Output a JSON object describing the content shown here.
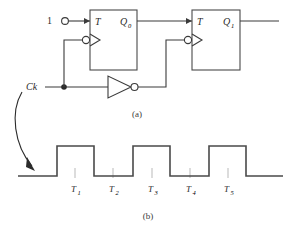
{
  "figure": {
    "colors": {
      "line": "#3b3b3b",
      "box": "#4a4a4a",
      "wave": "#4a4a4a",
      "tick": "#b9b9b9",
      "text": "#2b2b2b",
      "background": "#ffffff"
    }
  },
  "circuit": {
    "caption": "(a)",
    "input": {
      "label": "1",
      "terminal": "open-circle-terminal"
    },
    "clock": {
      "label": "Ck",
      "junction": "junction-dot"
    },
    "inverter": {
      "name": "not-gate",
      "symbol": "triangle-with-bubble"
    },
    "flipflops": [
      {
        "id": "ff0",
        "input_label": "T",
        "output_label": "Q",
        "output_subscript": "0",
        "clock_input": "negative-edge-triangle-with-bubble"
      },
      {
        "id": "ff1",
        "input_label": "T",
        "output_label": "Q",
        "output_subscript": "1",
        "clock_input": "negative-edge-triangle-with-bubble"
      }
    ]
  },
  "waveform": {
    "caption": "(b)",
    "arrow": "curved-arrow-from-ck-to-waveform",
    "periods": [
      {
        "label": "T",
        "subscript": "1"
      },
      {
        "label": "T",
        "subscript": "2"
      },
      {
        "label": "T",
        "subscript": "3"
      },
      {
        "label": "T",
        "subscript": "4"
      },
      {
        "label": "T",
        "subscript": "5"
      }
    ]
  }
}
